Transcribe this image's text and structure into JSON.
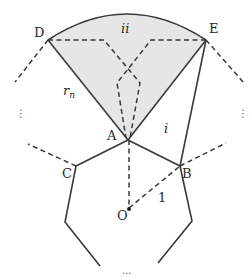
{
  "diagram": {
    "type": "geometry",
    "colors": {
      "shade": "#e6e6e6",
      "line": "#3a3a3a",
      "text": "#2a2a2a"
    },
    "points": {
      "D": {
        "label": "D",
        "x": 48,
        "y": 40
      },
      "E": {
        "label": "E",
        "x": 206,
        "y": 40
      },
      "A": {
        "label": "A",
        "x": 128,
        "y": 140
      },
      "B": {
        "label": "B",
        "x": 180,
        "y": 166
      },
      "C": {
        "label": "C",
        "x": 76,
        "y": 166
      },
      "O": {
        "label": "O",
        "x": 129,
        "y": 209
      }
    },
    "region_labels": {
      "ii": "ii",
      "i": "i",
      "rn_base": "r",
      "rn_sub": "n",
      "radius": "1"
    },
    "ellipsis": {
      "left": "⋮",
      "right": "⋮",
      "bottom": "..."
    }
  }
}
